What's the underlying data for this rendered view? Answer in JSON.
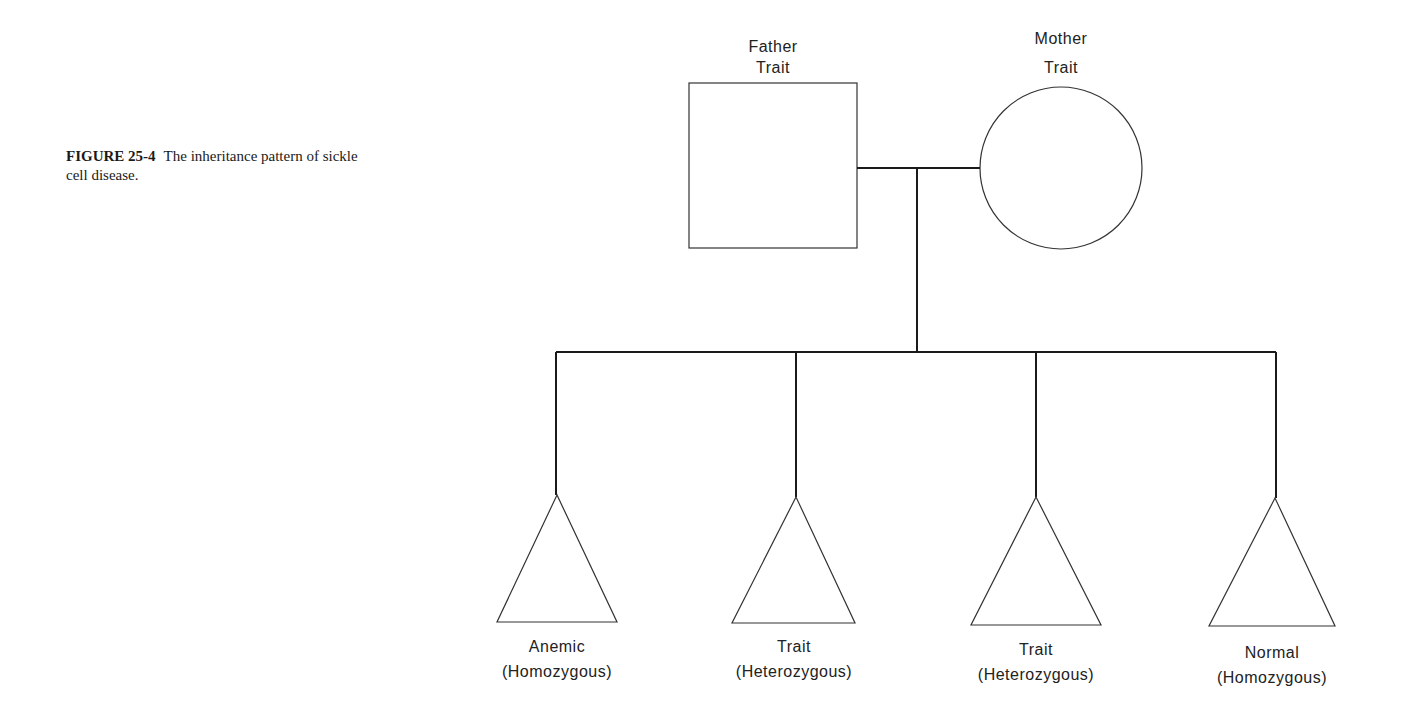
{
  "caption": {
    "figure_number": "FIGURE 25-4",
    "text": "The inheritance pattern of sickle cell disease."
  },
  "parents": {
    "father": {
      "line1": "Father",
      "line2": "Trait",
      "shape": "square"
    },
    "mother": {
      "line1": "Mother",
      "line2": "Trait",
      "shape": "circle"
    }
  },
  "children": [
    {
      "line1": "Anemic",
      "line2": "(Homozygous)",
      "shape": "triangle"
    },
    {
      "line1": "Trait",
      "line2": "(Heterozygous)",
      "shape": "triangle"
    },
    {
      "line1": "Trait",
      "line2": "(Heterozygous)",
      "shape": "triangle"
    },
    {
      "line1": "Normal",
      "line2": "(Homozygous)",
      "shape": "triangle"
    }
  ],
  "colors": {
    "line": "#1a1a1a",
    "background": "#ffffff"
  }
}
